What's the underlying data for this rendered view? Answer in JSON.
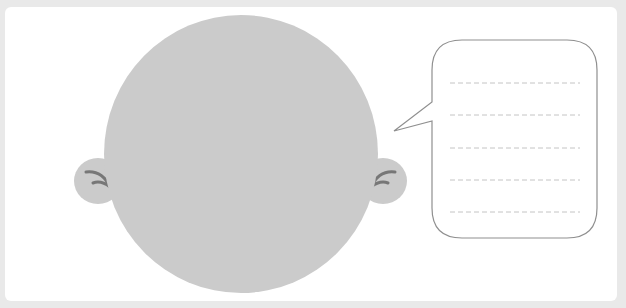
{
  "worksheet": {
    "head": {
      "fill_color": "#cbcbcb",
      "ear_mark_color": "#777777"
    },
    "speech_bubble": {
      "stroke_color": "#8f8f8f",
      "line_color": "#c4c4c4",
      "lines": [
        "",
        "",
        "",
        "",
        ""
      ]
    },
    "background_color": "#e9e9e9",
    "card_color": "#ffffff"
  }
}
